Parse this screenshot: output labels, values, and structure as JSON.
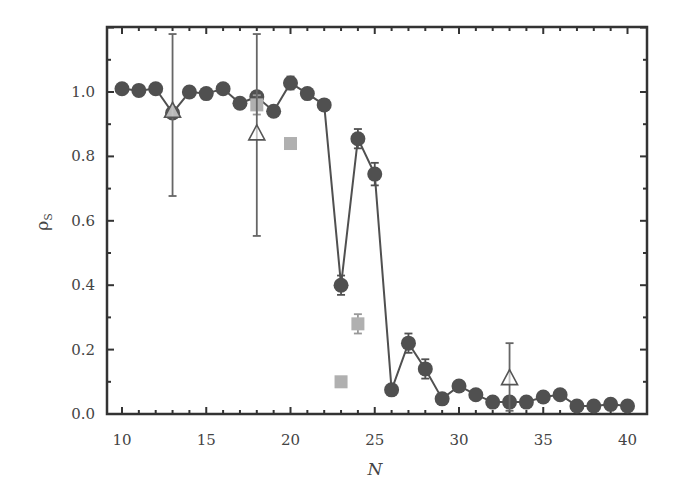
{
  "chart_data": {
    "type": "scatter",
    "title": "",
    "xlabel": "N",
    "ylabel": "ρS",
    "ylabel_main": "ρ",
    "ylabel_sub": "S",
    "xlim": [
      9,
      41
    ],
    "ylim": [
      0.0,
      1.2
    ],
    "xticks": [
      10,
      15,
      20,
      25,
      30,
      35,
      40
    ],
    "xtick_labels": [
      "10",
      "15",
      "20",
      "25",
      "30",
      "35",
      "40"
    ],
    "yticks": [
      0.0,
      0.2,
      0.4,
      0.6,
      0.8,
      1.0
    ],
    "ytick_labels": [
      "0.0",
      "0.2",
      "0.4",
      "0.6",
      "0.8",
      "1.0"
    ],
    "grid": false,
    "legend": null,
    "series": [
      {
        "name": "circles",
        "marker": "circle",
        "connected": true,
        "color": "#505050",
        "x": [
          10,
          11,
          12,
          13,
          14,
          15,
          16,
          17,
          18,
          19,
          20,
          21,
          22,
          23,
          24,
          25,
          26,
          27,
          28,
          29,
          30,
          31,
          32,
          33,
          34,
          35,
          36,
          37,
          38,
          39,
          40
        ],
        "y": [
          1.01,
          1.005,
          1.01,
          0.935,
          1.0,
          0.995,
          1.01,
          0.965,
          0.985,
          0.94,
          1.028,
          0.995,
          0.96,
          0.4,
          0.855,
          0.745,
          0.075,
          0.22,
          0.14,
          0.047,
          0.087,
          0.06,
          0.037,
          0.037,
          0.037,
          0.053,
          0.06,
          0.025,
          0.025,
          0.03,
          0.025
        ],
        "err": [
          0,
          0,
          0,
          0,
          0,
          0,
          0,
          0,
          0,
          0,
          0.02,
          0,
          0,
          0.03,
          0.03,
          0.035,
          0,
          0.03,
          0.03,
          0,
          0,
          0,
          0,
          0.015,
          0,
          0,
          0,
          0,
          0,
          0,
          0
        ]
      },
      {
        "name": "squares",
        "marker": "square",
        "connected": false,
        "color": "#b0b0b0",
        "x": [
          18,
          20,
          23,
          24
        ],
        "y": [
          0.96,
          0.84,
          0.1,
          0.28
        ],
        "err": [
          0.03,
          0,
          0,
          0.03
        ]
      },
      {
        "name": "triangles",
        "marker": "triangle-open",
        "connected": false,
        "color": "#555555",
        "x": [
          13,
          18,
          33
        ],
        "y": [
          0.94,
          0.87,
          0.11
        ],
        "err_low": [
          0.677,
          0.553,
          0.01
        ],
        "err_high": [
          1.18,
          1.18,
          0.22
        ]
      }
    ]
  }
}
